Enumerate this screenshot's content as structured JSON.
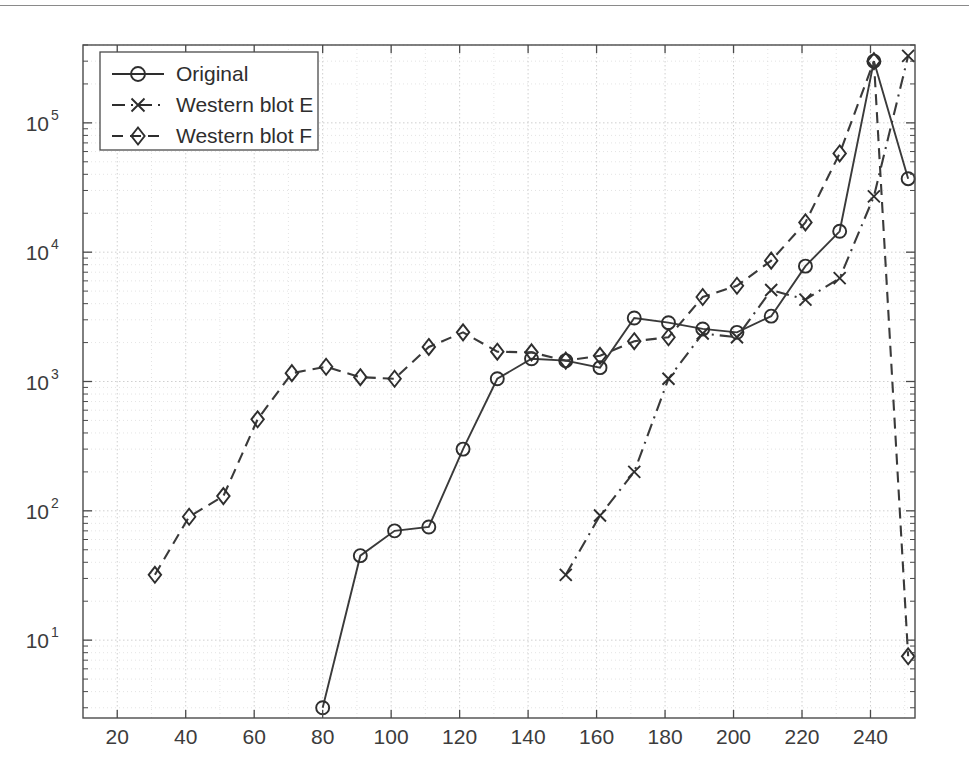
{
  "chart_data": {
    "type": "line",
    "title": "",
    "xlabel": "",
    "ylabel": "",
    "xlim": [
      10,
      253
    ],
    "ylim": [
      2.5,
      400000
    ],
    "yscale": "log",
    "xscale": "linear",
    "grid": true,
    "grid_style": "dotted",
    "legend_position": "upper left",
    "x_ticks": [
      20,
      40,
      60,
      80,
      100,
      120,
      140,
      160,
      180,
      200,
      220,
      240
    ],
    "x_tick_labels": [
      "20",
      "40",
      "60",
      "80",
      "100",
      "120",
      "140",
      "160",
      "180",
      "200",
      "220",
      "240"
    ],
    "y_ticks": [
      10,
      100,
      1000,
      10000,
      100000
    ],
    "y_tick_labels": [
      "10¹",
      "10²",
      "10³",
      "10⁴",
      "10⁵"
    ],
    "y_tick_mantissa": [
      "10",
      "10",
      "10",
      "10",
      "10"
    ],
    "y_tick_exponent": [
      "1",
      "2",
      "3",
      "4",
      "5"
    ],
    "series": [
      {
        "name": "Original",
        "marker": "circle",
        "linestyle": "solid",
        "color": "#3a3a3a",
        "x": [
          80,
          91,
          101,
          111,
          121,
          131,
          141,
          151,
          161,
          171,
          181,
          191,
          201,
          211,
          221,
          231,
          241,
          251
        ],
        "values": [
          3.0,
          45,
          70,
          75,
          300,
          1050,
          1500,
          1450,
          1280,
          3100,
          2850,
          2550,
          2400,
          3200,
          7800,
          14500,
          300000,
          37000
        ]
      },
      {
        "name": "Western blot E",
        "marker": "x",
        "linestyle": "dashdot",
        "color": "#3a3a3a",
        "x": [
          151,
          161,
          171,
          181,
          191,
          201,
          211,
          221,
          231,
          241,
          251
        ],
        "values": [
          32,
          92,
          200,
          1050,
          2350,
          2200,
          5100,
          4300,
          6300,
          27000,
          330000
        ]
      },
      {
        "name": "Western blot F",
        "marker": "diamond",
        "linestyle": "dashed",
        "color": "#3a3a3a",
        "x": [
          31,
          41,
          51,
          61,
          71,
          81,
          91,
          101,
          111,
          121,
          131,
          141,
          151,
          161,
          171,
          181,
          191,
          201,
          211,
          221,
          231,
          241,
          251
        ],
        "values": [
          32,
          90,
          130,
          510,
          1160,
          1300,
          1080,
          1050,
          1850,
          2400,
          1700,
          1680,
          1450,
          1580,
          2050,
          2200,
          4500,
          5500,
          8600,
          17000,
          58000,
          300000,
          7.5
        ]
      }
    ],
    "legend": [
      {
        "label": "Original",
        "marker": "circle",
        "linestyle": "solid"
      },
      {
        "label": "Western blot E",
        "marker": "x",
        "linestyle": "dashdot"
      },
      {
        "label": "Western blot F",
        "marker": "diamond",
        "linestyle": "dashed"
      }
    ]
  },
  "plot_area": {
    "left": 83,
    "right": 915,
    "top": 45,
    "bottom": 718
  }
}
